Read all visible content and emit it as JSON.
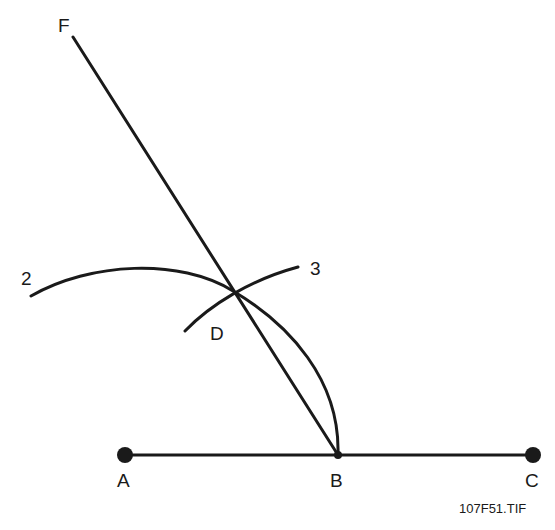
{
  "diagram": {
    "type": "geometric-construction",
    "labels": {
      "F": "F",
      "arc2": "2",
      "arc3": "3",
      "D": "D",
      "A": "A",
      "B": "B",
      "C": "C"
    },
    "caption": "107F51.TIF",
    "points": {
      "A": [
        125,
        455
      ],
      "B": [
        338,
        455
      ],
      "C": [
        533,
        455
      ],
      "D": [
        233,
        291
      ],
      "F": [
        72,
        37
      ]
    },
    "colors": {
      "ink": "#1a1a1a",
      "background": "#ffffff"
    }
  }
}
